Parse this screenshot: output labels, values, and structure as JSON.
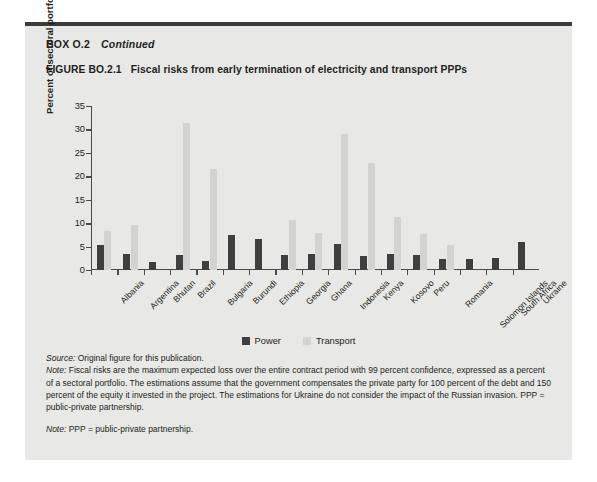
{
  "box": {
    "label": "BOX O.2",
    "continued": "Continued"
  },
  "figure": {
    "number": "FIGURE BO.2.1",
    "title": "Fiscal risks from early termination of electricity and transport PPPs"
  },
  "chart_data": {
    "type": "bar",
    "title": "Fiscal risks from early termination of electricity and transport PPPs",
    "xlabel": "",
    "ylabel": "Percent of sectoral portfolio",
    "ylim": [
      0,
      35
    ],
    "yticks": [
      0,
      5,
      10,
      15,
      20,
      25,
      30,
      35
    ],
    "grid": false,
    "legend_position": "bottom-center",
    "categories": [
      "Albania",
      "Argentina",
      "Bhutan",
      "Brazil",
      "Bulgaria",
      "Burundi",
      "Ethiopia",
      "Georgia",
      "Ghana",
      "Indonesia",
      "Kenya",
      "Kosovo",
      "Peru",
      "Romania",
      "Solomon Islands",
      "South Africa",
      "Ukraine"
    ],
    "series": [
      {
        "name": "Power",
        "color": "#3f3f3f",
        "values": [
          5.4,
          3.4,
          1.8,
          3.3,
          2.0,
          7.4,
          6.6,
          3.1,
          3.4,
          5.5,
          3.0,
          3.4,
          3.1,
          2.4,
          2.3,
          2.5,
          5.9
        ]
      },
      {
        "name": "Transport",
        "color": "#d3d3d1",
        "values": [
          8.4,
          9.6,
          0.0,
          31.4,
          21.5,
          0.0,
          0.0,
          10.6,
          8.0,
          29.0,
          22.9,
          11.3,
          7.6,
          5.4,
          0.0,
          0.0,
          0.0
        ]
      }
    ]
  },
  "legend": {
    "items": [
      {
        "label": "Power",
        "color": "#3f3f3f"
      },
      {
        "label": "Transport",
        "color": "#d3d3d1"
      }
    ]
  },
  "notes": {
    "source_label": "Source:",
    "source_text": " Original figure for this publication.",
    "note_label": "Note:",
    "note_text": " Fiscal risks are the maximum expected loss over the entire contract period with 99 percent confidence, expressed as a percent of a sectoral portfolio. The estimations assume that the government compensates the private party for 100 percent of the debt and 150 percent of the equity it invested in the project. The estimations for Ukraine do not consider the impact of the Russian invasion. PPP = public-private partnership.",
    "note2_label": "Note:",
    "note2_text": " PPP = public-private partnership."
  }
}
